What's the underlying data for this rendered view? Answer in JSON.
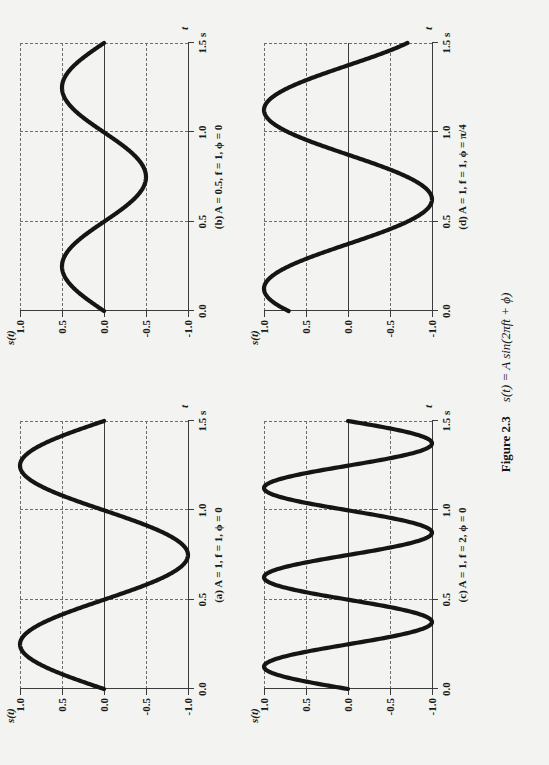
{
  "figure": {
    "number_label": "Figure 2.3",
    "equation": "s(t) = A sin(2πft + ϕ)",
    "axis_y_name": "s(t)",
    "axis_x_name": "t",
    "y_ticks": [
      "1.0",
      "0.5",
      "0.0",
      "-0.5",
      "-1.0"
    ],
    "x_ticks": [
      "0.0",
      "0.5",
      "1.0",
      "1.5 s"
    ],
    "panels": [
      {
        "id": "a",
        "caption": "(a) A = 1, f = 1, ϕ = 0",
        "amplitude": 1.0,
        "frequency": 1.0,
        "phase": "0"
      },
      {
        "id": "b",
        "caption": "(b) A = 0.5, f = 1, ϕ = 0",
        "amplitude": 0.5,
        "frequency": 1.0,
        "phase": "0"
      },
      {
        "id": "c",
        "caption": "(c) A = 1, f = 2, ϕ = 0",
        "amplitude": 1.0,
        "frequency": 2.0,
        "phase": "0"
      },
      {
        "id": "d",
        "caption": "(d) A = 1, f = 1, ϕ = π/4",
        "amplitude": 1.0,
        "frequency": 1.0,
        "phase": "π/4"
      }
    ]
  },
  "chart_data": [
    {
      "type": "line",
      "title": "(a) A = 1, f = 1, ϕ = 0",
      "xlabel": "t",
      "ylabel": "s(t)",
      "xlim": [
        0.0,
        1.5
      ],
      "ylim": [
        -1.0,
        1.0
      ],
      "xticks": [
        0.0,
        0.5,
        1.0,
        1.5
      ],
      "xticklabels": [
        "0.0",
        "0.5",
        "1.0",
        "1.5 s"
      ],
      "yticks": [
        -1.0,
        -0.5,
        0.0,
        0.5,
        1.0
      ],
      "yticklabels": [
        "-1.0",
        "-0.5",
        "0.0",
        "0.5",
        "1.0"
      ],
      "grid": true,
      "legend": false,
      "equation": "s(t) = 1 * sin(2*pi*1*t + 0)",
      "params": {
        "A": 1.0,
        "f": 1.0,
        "phi": 0.0
      },
      "x": [
        0.0,
        0.125,
        0.25,
        0.375,
        0.5,
        0.625,
        0.75,
        0.875,
        1.0,
        1.125,
        1.25,
        1.375,
        1.5
      ],
      "y": [
        0.0,
        0.707,
        1.0,
        0.707,
        0.0,
        -0.707,
        -1.0,
        -0.707,
        0.0,
        0.707,
        1.0,
        0.707,
        0.0
      ]
    },
    {
      "type": "line",
      "title": "(b) A = 0.5, f = 1, ϕ = 0",
      "xlabel": "t",
      "ylabel": "s(t)",
      "xlim": [
        0.0,
        1.5
      ],
      "ylim": [
        -1.0,
        1.0
      ],
      "xticks": [
        0.0,
        0.5,
        1.0,
        1.5
      ],
      "xticklabels": [
        "0.0",
        "0.5",
        "1.0",
        "1.5 s"
      ],
      "yticks": [
        -1.0,
        -0.5,
        0.0,
        0.5,
        1.0
      ],
      "yticklabels": [
        "-1.0",
        "-0.5",
        "0.0",
        "0.5",
        "1.0"
      ],
      "grid": true,
      "legend": false,
      "equation": "s(t) = 0.5 * sin(2*pi*1*t + 0)",
      "params": {
        "A": 0.5,
        "f": 1.0,
        "phi": 0.0
      },
      "x": [
        0.0,
        0.125,
        0.25,
        0.375,
        0.5,
        0.625,
        0.75,
        0.875,
        1.0,
        1.125,
        1.25,
        1.375,
        1.5
      ],
      "y": [
        0.0,
        0.354,
        0.5,
        0.354,
        0.0,
        -0.354,
        -0.5,
        -0.354,
        0.0,
        0.354,
        0.5,
        0.354,
        0.0
      ]
    },
    {
      "type": "line",
      "title": "(c) A = 1, f = 2, ϕ = 0",
      "xlabel": "t",
      "ylabel": "s(t)",
      "xlim": [
        0.0,
        1.5
      ],
      "ylim": [
        -1.0,
        1.0
      ],
      "xticks": [
        0.0,
        0.5,
        1.0,
        1.5
      ],
      "xticklabels": [
        "0.0",
        "0.5",
        "1.0",
        "1.5 s"
      ],
      "yticks": [
        -1.0,
        -0.5,
        0.0,
        0.5,
        1.0
      ],
      "yticklabels": [
        "-1.0",
        "-0.5",
        "0.0",
        "0.5",
        "1.0"
      ],
      "grid": true,
      "legend": false,
      "equation": "s(t) = 1 * sin(2*pi*2*t + 0)",
      "params": {
        "A": 1.0,
        "f": 2.0,
        "phi": 0.0
      },
      "x": [
        0.0,
        0.0625,
        0.125,
        0.1875,
        0.25,
        0.375,
        0.5,
        0.625,
        0.75,
        0.875,
        1.0,
        1.125,
        1.25,
        1.375,
        1.5
      ],
      "y": [
        0.0,
        0.707,
        1.0,
        0.707,
        0.0,
        -1.0,
        0.0,
        1.0,
        0.0,
        -1.0,
        0.0,
        1.0,
        0.0,
        -1.0,
        0.0
      ]
    },
    {
      "type": "line",
      "title": "(d) A = 1, f = 1, ϕ = π/4",
      "xlabel": "t",
      "ylabel": "s(t)",
      "xlim": [
        0.0,
        1.5
      ],
      "ylim": [
        -1.0,
        1.0
      ],
      "xticks": [
        0.0,
        0.5,
        1.0,
        1.5
      ],
      "xticklabels": [
        "0.0",
        "0.5",
        "1.0",
        "1.5 s"
      ],
      "yticks": [
        -1.0,
        -0.5,
        0.0,
        0.5,
        1.0
      ],
      "yticklabels": [
        "-1.0",
        "-0.5",
        "0.0",
        "0.5",
        "1.0"
      ],
      "grid": true,
      "legend": false,
      "equation": "s(t) = 1 * sin(2*pi*1*t + pi/4)",
      "params": {
        "A": 1.0,
        "f": 1.0,
        "phi": 0.7854
      },
      "x": [
        0.0,
        0.125,
        0.25,
        0.375,
        0.5,
        0.625,
        0.75,
        0.875,
        1.0,
        1.125,
        1.25,
        1.375,
        1.5
      ],
      "y": [
        0.707,
        1.0,
        0.707,
        0.0,
        -0.707,
        -1.0,
        -0.707,
        0.0,
        0.707,
        1.0,
        0.707,
        0.0,
        -0.707
      ]
    }
  ]
}
